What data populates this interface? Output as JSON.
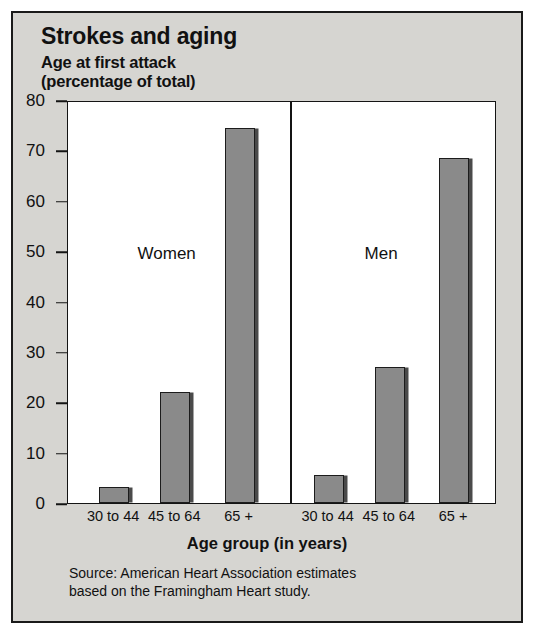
{
  "chart_data": {
    "type": "bar",
    "title": "Strokes and aging",
    "subtitle": "Age at first attack\n(percentage of total)",
    "xlabel": "Age group (in years)",
    "ylabel": "",
    "ylim": [
      0,
      80
    ],
    "yticks": [
      0,
      10,
      20,
      30,
      40,
      50,
      60,
      70,
      80
    ],
    "ytick_labels": [
      "0",
      "10",
      "20",
      "30",
      "40",
      "50",
      "60",
      "70",
      "80"
    ],
    "grid": false,
    "legend_position": "in-plot-annotation",
    "categories": [
      "30 to 44",
      "45 to 64",
      "65 +"
    ],
    "groups": [
      {
        "name": "Women",
        "categories": [
          "30 to 44",
          "45 to 64",
          "65 +"
        ],
        "values": [
          3.2,
          22,
          74.5
        ]
      },
      {
        "name": "Men",
        "categories": [
          "30 to 44",
          "45 to 64",
          "65 +"
        ],
        "values": [
          5.5,
          27,
          68.5
        ]
      }
    ],
    "series": [
      {
        "name": "Women",
        "values": [
          3.2,
          22,
          74.5
        ]
      },
      {
        "name": "Men",
        "values": [
          5.5,
          27,
          68.5
        ]
      }
    ],
    "annotations": [
      "Women",
      "Men"
    ],
    "source": "Source: American Heart Association estimates\nbased on the Framingham Heart study.",
    "colors": {
      "bar_fill": "#8a8a8a",
      "bar_outline": "#1c1c1c",
      "bar_shadow": "#4a4a4a",
      "plot_background": "#ffffff",
      "figure_background": "#d6d5d1",
      "text": "#111111"
    }
  }
}
